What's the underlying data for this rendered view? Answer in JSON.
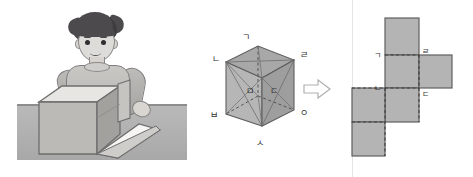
{
  "figure": {
    "panels": [
      {
        "name": "photo-illustration",
        "caption": "boy unfolding a cardboard box"
      },
      {
        "name": "cube-diagram",
        "caption": "labeled cube"
      },
      {
        "name": "arrow",
        "glyph": "⇨"
      },
      {
        "name": "net-diagram",
        "caption": "net of the cube"
      }
    ]
  },
  "cube": {
    "vertex_labels": {
      "top": "ㄱ",
      "top_right": "ㄹ",
      "left": "ㄴ",
      "inner_left": "ㅁ",
      "inner_right": "ㄷ",
      "bottom_left": "ㅂ",
      "bottom": "ㅅ",
      "right": "ㅇ"
    }
  },
  "net": {
    "labels": {
      "upper_left": "ㄱ",
      "upper_right": "ㄹ",
      "mid_left": "ㄴ",
      "mid_right": "ㄷ"
    }
  },
  "colors": {
    "fill": "#b4b4b4",
    "stroke": "#5f5f5f",
    "dashed": "#4a4a4a",
    "table": "#b2b2b2",
    "hair": "#4c4a4d",
    "skin": "#dedcd8",
    "shirt": "#c2c0bd"
  }
}
